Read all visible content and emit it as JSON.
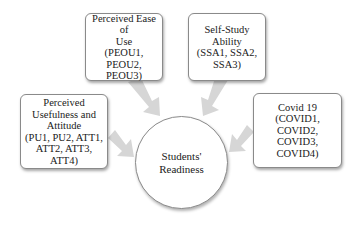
{
  "diagram": {
    "center": {
      "lines": [
        "Students'",
        "Readiness"
      ]
    },
    "factors": [
      {
        "id": "peou",
        "lines": [
          "Perceived Ease of",
          "Use",
          "(PEOU1, PEOU2,",
          "PEOU3)"
        ]
      },
      {
        "id": "ssa",
        "lines": [
          "Self-Study Ability",
          "(SSA1, SSA2,",
          "SSA3)"
        ]
      },
      {
        "id": "pu-att",
        "lines": [
          "Perceived",
          "Usefulness and",
          "Attitude",
          "(PU1, PU2, ATT1,",
          "ATT2, ATT3,",
          "ATT4)"
        ]
      },
      {
        "id": "covid",
        "lines": [
          "Covid 19",
          "(COVID1,",
          "COVID2,",
          "COVID3,",
          "COVID4)"
        ]
      }
    ],
    "arrow_color": "#d4d4d4",
    "border_color": "#8a8a8a"
  }
}
